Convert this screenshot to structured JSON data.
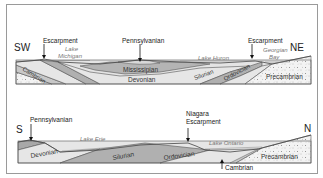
{
  "figure": {
    "top_section": {
      "direction_left": "SW",
      "direction_right": "NE",
      "annotations": {
        "escarpment_left": "Escarpment",
        "escarpment_right": "Escarpment",
        "pennsylvanian": "Pennsylvanian"
      },
      "lakes": {
        "michigan_line1": "Lake",
        "michigan_line2": "Michigan",
        "huron": "Lake Huron",
        "georgian_line1": "Georgian",
        "georgian_line2": "Bay"
      },
      "strata": {
        "cambrian": "Cambrian",
        "mississippian": "Mississipian",
        "devonian": "Devonian",
        "silurian": "Silurian",
        "ordovician": "Ordovician",
        "precambrian": "Precambrian"
      }
    },
    "bottom_section": {
      "direction_left": "S",
      "direction_right": "N",
      "annotations": {
        "pennsylvanian": "Pennsylvanian",
        "niagara_line1": "Niagara",
        "niagara_line2": "Escarpment",
        "cambrian": "Cambrian"
      },
      "lakes": {
        "erie": "Lake  Erie",
        "ontario": "Lake Ontario"
      },
      "strata": {
        "devonian": "Devonian",
        "silurian": "Silurian",
        "ordovician": "Ordovician",
        "precambrian": "Precambrian"
      }
    },
    "colors": {
      "frame": "#9a9a9a",
      "light_layer": "#e6e6e6",
      "mid_layer": "#c4c4c4",
      "dark_layer": "#a8a8a8",
      "precambrian_fill": "#f2f2f2",
      "outline": "#555555"
    }
  }
}
